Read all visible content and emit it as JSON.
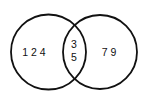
{
  "diagram": {
    "type": "venn",
    "background": "#ffffff",
    "stroke_color": "#111111",
    "text_color": "#111111",
    "sets": [
      {
        "id": "left",
        "center": [
          48.5,
          52
        ],
        "radius": 37.5
      },
      {
        "id": "right",
        "center": [
          100,
          52
        ],
        "radius": 37
      }
    ],
    "regions": {
      "left_only": {
        "label": "1 2 4",
        "values": [
          1,
          2,
          4
        ]
      },
      "intersection": {
        "line1": "3",
        "line2": "5",
        "values": [
          3,
          5
        ]
      },
      "right_only": {
        "label": "7 9",
        "values": [
          7,
          9
        ]
      }
    }
  }
}
